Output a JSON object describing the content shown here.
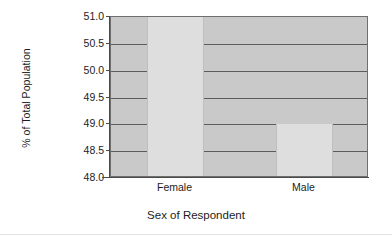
{
  "chart_data": {
    "type": "bar",
    "title": "",
    "subtitle": "",
    "xlabel": "Sex of Respondent",
    "ylabel": "% of Total Population",
    "categories": [
      "Female",
      "Male"
    ],
    "values": [
      51.0,
      49.0
    ],
    "series": [
      {
        "name": "% of Total Population",
        "values": [
          51.0,
          49.0
        ]
      }
    ],
    "ylim": [
      48.0,
      51.0
    ],
    "yticks": [
      48.0,
      48.5,
      49.0,
      49.5,
      50.0,
      50.5,
      51.0
    ],
    "ytick_labels": [
      "48.0",
      "48.5",
      "49.0",
      "49.5",
      "50.0",
      "50.5",
      "51.0"
    ],
    "grid": true,
    "grid_axis": "y",
    "legend": false,
    "legend_position": "none",
    "colors": {
      "plot_background": "#c9c9c9",
      "bar_fill": "#dedede",
      "gridline": "#5c5c5c",
      "axis_line": "#4a4a4a",
      "text": "#1c1c1c",
      "page_background": "#ffffff"
    }
  },
  "axes": {
    "y_title": "% of Total Population",
    "x_title": "Sex of Respondent",
    "y_ticks": [
      {
        "label": "51.0",
        "value": 51.0
      },
      {
        "label": "50.5",
        "value": 50.5
      },
      {
        "label": "50.0",
        "value": 50.0
      },
      {
        "label": "49.5",
        "value": 49.5
      },
      {
        "label": "49.0",
        "value": 49.0
      },
      {
        "label": "48.5",
        "value": 48.5
      },
      {
        "label": "48.0",
        "value": 48.0
      }
    ],
    "x_categories": [
      {
        "label": "Female"
      },
      {
        "label": "Male"
      }
    ]
  }
}
